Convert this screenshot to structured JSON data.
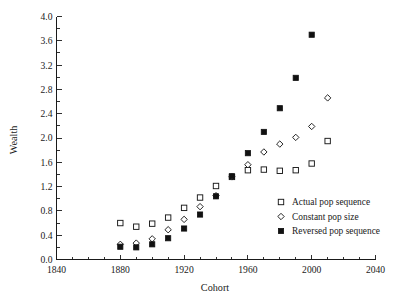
{
  "figure": {
    "partial_title_fragment": "",
    "background_color": "#ffffff",
    "ink_color": "#1a1a1a"
  },
  "axes": {
    "x": {
      "label": "Cohort",
      "min": 1840,
      "max": 2040,
      "major_step": 40,
      "minor_step": 10,
      "tick_labels": [
        "1840",
        "1880",
        "1920",
        "1960",
        "2000",
        "2040"
      ],
      "tick_values": [
        1840,
        1880,
        1920,
        1960,
        2000,
        2040
      ]
    },
    "y": {
      "label": "Wealth",
      "min": 0.0,
      "max": 4.0,
      "major_step": 0.4,
      "tick_labels": [
        "0.0",
        "0.4",
        "0.8",
        "1.2",
        "1.6",
        "2.0",
        "2.4",
        "2.8",
        "3.2",
        "3.6",
        "4.0"
      ],
      "tick_values": [
        0.0,
        0.4,
        0.8,
        1.2,
        1.6,
        2.0,
        2.4,
        2.8,
        3.2,
        3.6,
        4.0
      ]
    }
  },
  "legend": {
    "position": "inside-lower-right",
    "entries": [
      {
        "label": "Actual pop sequence",
        "marker": "open-square",
        "color": "#1a1a1a"
      },
      {
        "label": "Constant pop size",
        "marker": "open-diamond",
        "color": "#1a1a1a"
      },
      {
        "label": "Reversed pop sequence",
        "marker": "filled-square",
        "color": "#111111"
      }
    ]
  },
  "chart_data": {
    "type": "scatter",
    "title": "",
    "xlabel": "Cohort",
    "ylabel": "Wealth",
    "xlim": [
      1840,
      2040
    ],
    "ylim": [
      0.0,
      4.0
    ],
    "grid": false,
    "legend_position": "inside-lower-right",
    "x": [
      1880,
      1890,
      1900,
      1910,
      1920,
      1930,
      1940,
      1950,
      1960,
      1970,
      1980,
      1990,
      2000,
      2010
    ],
    "series": [
      {
        "name": "Actual pop sequence",
        "marker": "open-square",
        "values": [
          0.6,
          0.54,
          0.59,
          0.69,
          0.85,
          1.02,
          1.21,
          1.36,
          1.47,
          1.48,
          1.46,
          1.47,
          1.58,
          1.95
        ]
      },
      {
        "name": "Constant pop size",
        "marker": "open-diamond",
        "values": [
          0.25,
          0.27,
          0.34,
          0.49,
          0.66,
          0.87,
          1.05,
          1.36,
          1.56,
          1.77,
          1.9,
          2.01,
          2.19,
          2.66
        ]
      },
      {
        "name": "Reversed pop sequence",
        "marker": "filled-square",
        "values": [
          0.21,
          0.2,
          0.25,
          0.35,
          0.51,
          0.74,
          1.04,
          1.37,
          1.75,
          2.1,
          2.49,
          2.99,
          3.7,
          null
        ]
      }
    ]
  }
}
